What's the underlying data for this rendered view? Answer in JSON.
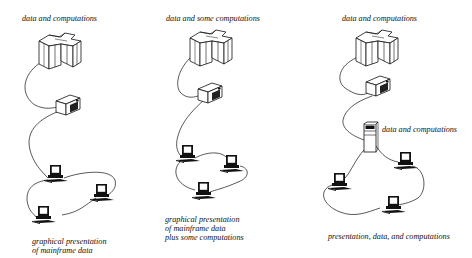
{
  "figure": {
    "panels": [
      {
        "id": "panel-1",
        "top_label": "data and computations",
        "caption_lines": [
          "graphical presentation",
          "of mainframe data"
        ],
        "nodes": [
          "mainframe",
          "controller",
          "workstation",
          "workstation",
          "workstation"
        ]
      },
      {
        "id": "panel-2",
        "top_label": "data and some computations",
        "caption_lines": [
          "graphical presentation",
          "of mainframe data",
          "plus some computations"
        ],
        "nodes": [
          "mainframe",
          "controller",
          "workstation",
          "workstation",
          "workstation"
        ]
      },
      {
        "id": "panel-3",
        "top_label": "data and computations",
        "server_label": "data and computations",
        "caption_lines": [
          "presentation, data, and computations"
        ],
        "nodes": [
          "mainframe",
          "controller",
          "server",
          "workstation",
          "workstation",
          "workstation"
        ]
      }
    ],
    "colors": {
      "background": "#ffffff",
      "ink": "#111111"
    }
  }
}
